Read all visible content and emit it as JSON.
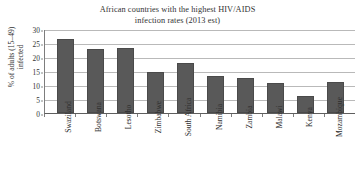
{
  "chart_data": {
    "type": "bar",
    "title": "African countries with the highest HIV/AIDS infection rates (2013 est)",
    "title_lines": [
      "African countries with the highest HIV/AIDS",
      "infection rates (2013 est)"
    ],
    "xlabel": "",
    "ylabel": "% of adults (15–49) infected",
    "ylabel_lines": [
      "% of adults (15–49)",
      "infected"
    ],
    "ylim": [
      0,
      30
    ],
    "ytick_labels": [
      "0",
      "5",
      "10",
      "15",
      "20",
      "25",
      "30"
    ],
    "ytick_values": [
      0,
      5,
      10,
      15,
      20,
      25,
      30
    ],
    "grid": true,
    "legend": false,
    "categories": [
      "Swaziland",
      "Botswana",
      "Lesotho",
      "Zimbabwe",
      "South Africa",
      "Namibia",
      "Zambia",
      "Malawi",
      "Kenya",
      "Mozambique"
    ],
    "values": [
      26.5,
      23.0,
      23.1,
      14.7,
      17.9,
      13.3,
      12.5,
      10.8,
      6.0,
      11.0
    ],
    "bar_color": "#595959",
    "grid_color": "#b9b9b9",
    "axis_color": "#5e5e5e"
  }
}
